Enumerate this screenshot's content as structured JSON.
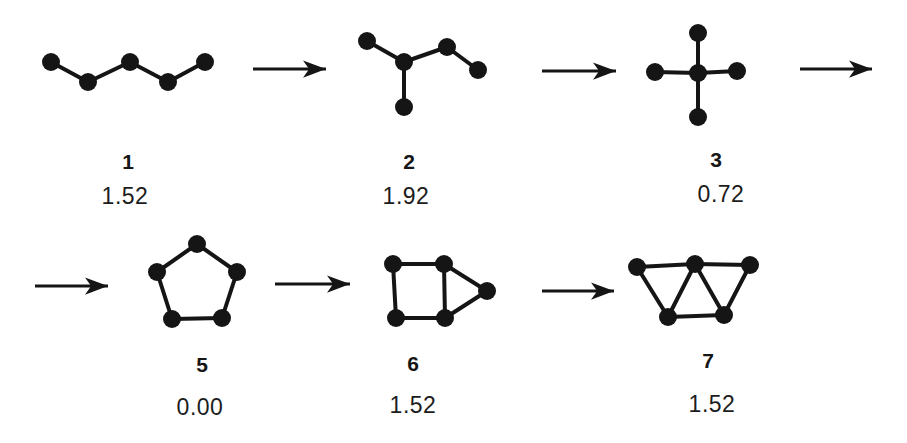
{
  "canvas": {
    "width": 907,
    "height": 443,
    "background": "#ffffff",
    "ink_color": "#151515"
  },
  "structures": [
    {
      "label": "1",
      "value": "1.52",
      "nodes": [
        [
          51,
          62
        ],
        [
          88,
          82
        ],
        [
          130,
          62
        ],
        [
          168,
          82
        ],
        [
          205,
          62
        ]
      ],
      "edges": [
        [
          0,
          1
        ],
        [
          1,
          2
        ],
        [
          2,
          3
        ],
        [
          3,
          4
        ]
      ]
    },
    {
      "label": "2",
      "value": "1.92",
      "nodes": [
        [
          367,
          41
        ],
        [
          404,
          62
        ],
        [
          404,
          107
        ],
        [
          447,
          47
        ],
        [
          478,
          70
        ]
      ],
      "edges": [
        [
          0,
          1
        ],
        [
          1,
          2
        ],
        [
          1,
          3
        ],
        [
          3,
          4
        ]
      ]
    },
    {
      "label": "3",
      "value": "0.72",
      "nodes": [
        [
          698,
          73
        ],
        [
          698,
          33
        ],
        [
          655,
          72
        ],
        [
          737,
          71
        ],
        [
          698,
          117
        ]
      ],
      "edges": [
        [
          0,
          1
        ],
        [
          0,
          2
        ],
        [
          0,
          3
        ],
        [
          0,
          4
        ]
      ]
    },
    {
      "label": "5",
      "value": "0.00",
      "nodes": [
        [
          197,
          244
        ],
        [
          157,
          272
        ],
        [
          237,
          272
        ],
        [
          172,
          319
        ],
        [
          222,
          318
        ]
      ],
      "edges": [
        [
          0,
          1
        ],
        [
          0,
          2
        ],
        [
          1,
          3
        ],
        [
          3,
          4
        ],
        [
          4,
          2
        ]
      ]
    },
    {
      "label": "6",
      "value": "1.52",
      "nodes": [
        [
          393,
          264
        ],
        [
          444,
          264
        ],
        [
          396,
          318
        ],
        [
          445,
          318
        ],
        [
          487,
          291
        ]
      ],
      "edges": [
        [
          0,
          1
        ],
        [
          0,
          2
        ],
        [
          2,
          3
        ],
        [
          1,
          3
        ],
        [
          1,
          4
        ],
        [
          3,
          4
        ]
      ]
    },
    {
      "label": "7",
      "value": "1.52",
      "nodes": [
        [
          637,
          267
        ],
        [
          695,
          264
        ],
        [
          750,
          265
        ],
        [
          668,
          317
        ],
        [
          724,
          315
        ]
      ],
      "edges": [
        [
          0,
          1
        ],
        [
          1,
          2
        ],
        [
          0,
          3
        ],
        [
          3,
          4
        ],
        [
          4,
          2
        ],
        [
          1,
          3
        ],
        [
          1,
          4
        ]
      ]
    }
  ],
  "arrows": [
    {
      "x1": 253,
      "y1": 69,
      "x2": 326,
      "y2": 69
    },
    {
      "x1": 542,
      "y1": 71,
      "x2": 616,
      "y2": 71
    },
    {
      "x1": 800,
      "y1": 69,
      "x2": 872,
      "y2": 69
    },
    {
      "x1": 35,
      "y1": 286,
      "x2": 108,
      "y2": 286
    },
    {
      "x1": 275,
      "y1": 284,
      "x2": 350,
      "y2": 284
    },
    {
      "x1": 542,
      "y1": 291,
      "x2": 614,
      "y2": 291
    }
  ],
  "style": {
    "node_radius": 9,
    "edge_width": 4,
    "arrow_width": 3
  }
}
